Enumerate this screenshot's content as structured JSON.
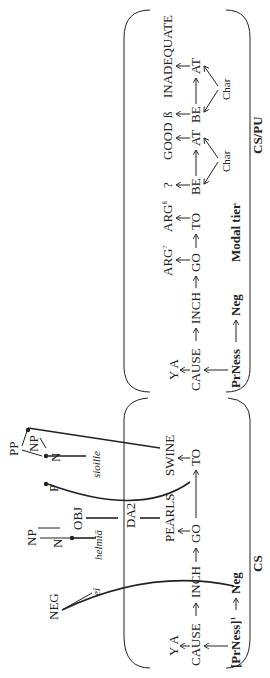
{
  "panels": {
    "cs": {
      "label": "CS",
      "row_top": [
        "Y A"
      ],
      "row_main": [
        "CAUSE",
        "INCH",
        "GO",
        "TO"
      ],
      "row_bottom": {
        "prness": "[PrNess]",
        "prness_sup": "1",
        "neg": "Neg"
      },
      "syntax": {
        "neg": "NEG",
        "ei": "ei",
        "np1": "NP",
        "n1": "N",
        "helmia": "helmiä",
        "obj": "OBJ",
        "da2": "DA2",
        "pearls": "PEARLS",
        "pp": "PP",
        "np2": "NP",
        "n2": "N",
        "p": "P",
        "sioille": "sioille",
        "swine": "SWINE"
      }
    },
    "modal": {
      "label": "Modal tier",
      "row_top": [
        "Y A",
        "ARG",
        "ARG"
      ],
      "arg1_sup": "?",
      "arg2_sup": "ß",
      "row_main": [
        "CAUSE",
        "INCH",
        "GO",
        "TO"
      ],
      "row_bottom": {
        "prness": "PrNess",
        "neg": "Neg"
      }
    },
    "cspu": {
      "label": "CS/PU",
      "items": [
        {
          "top": "?",
          "label": "GOOD",
          "be": "BE",
          "at": "AT",
          "char": "Char"
        },
        {
          "top": "ß",
          "label": "INADEQUATE",
          "be": "BE",
          "at": "AT",
          "char": "Char"
        }
      ]
    }
  },
  "arrow": "→"
}
